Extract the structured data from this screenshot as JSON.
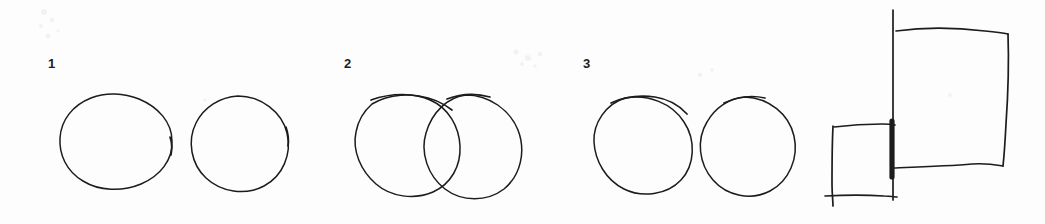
{
  "document": {
    "kind": "scanned-handwritten-sketch",
    "medium": "pen on white paper",
    "background_color": "#fdfdfd",
    "ink_color": "#1d1b1b",
    "width": 1045,
    "height": 224
  },
  "labels": {
    "group1": "1",
    "group2": "2",
    "group3": "3"
  },
  "figures": [
    {
      "id": "group-1",
      "label": "1",
      "description": "two separate non-touching circles",
      "relation": "disjoint",
      "shape": "circle",
      "count": 2,
      "shapes": [
        {
          "name": "circle-1a",
          "cx": 116,
          "cy": 141,
          "rx": 56,
          "ry": 48
        },
        {
          "name": "circle-1b",
          "cx": 239,
          "cy": 144,
          "rx": 49,
          "ry": 48
        }
      ]
    },
    {
      "id": "group-2",
      "label": "2",
      "description": "two overlapping circles forming a lens-shaped intersection",
      "relation": "overlapping",
      "shape": "circle",
      "count": 2,
      "shapes": [
        {
          "name": "circle-2a",
          "cx": 404,
          "cy": 144,
          "rx": 56,
          "ry": 51
        },
        {
          "name": "circle-2b",
          "cx": 471,
          "cy": 146,
          "rx": 54,
          "ry": 51
        }
      ]
    },
    {
      "id": "group-3",
      "label": "3",
      "description": "two circles touching at a single tangent point",
      "relation": "tangent",
      "shape": "circle",
      "count": 2,
      "shapes": [
        {
          "name": "circle-3a",
          "cx": 643,
          "cy": 145,
          "rx": 50,
          "ry": 48
        },
        {
          "name": "circle-3b",
          "cx": 743,
          "cy": 147,
          "rx": 51,
          "ry": 50
        }
      ]
    },
    {
      "id": "group-4",
      "label": "",
      "description": "a large rectangle and a smaller rectangle sharing a common, heavily overdrawn vertical edge",
      "relation": "adjacent-shared-edge",
      "shape": "rectangle",
      "count": 2,
      "shapes": [
        {
          "name": "rectangle-large",
          "x": 893,
          "y": 30,
          "width": 114,
          "height": 136
        },
        {
          "name": "rectangle-small",
          "x": 832,
          "y": 124,
          "width": 63,
          "height": 76
        }
      ]
    }
  ]
}
